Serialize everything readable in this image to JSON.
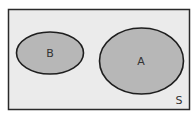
{
  "diagram": {
    "type": "venn",
    "universe": {
      "label": "S",
      "fill": "#ebebeb",
      "stroke": "#2a2a2a"
    },
    "sets": [
      {
        "label": "B",
        "fill": "#b7b7b7",
        "stroke": "#1e1e1e"
      },
      {
        "label": "A",
        "fill": "#b7b7b7",
        "stroke": "#1e1e1e"
      }
    ],
    "relationship": "disjoint"
  }
}
